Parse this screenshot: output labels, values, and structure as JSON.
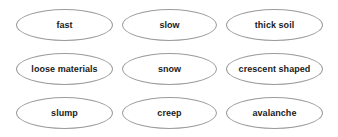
{
  "diagram": {
    "type": "oval-word-bank",
    "rows": 3,
    "columns": 3,
    "background_color": "#ffffff",
    "oval_border_color": "#9c9c9c",
    "text_color": "#1b1b1b",
    "cells": [
      [
        {
          "label": "fast"
        },
        {
          "label": "slow"
        },
        {
          "label": "thick soil"
        }
      ],
      [
        {
          "label": "loose materials"
        },
        {
          "label": "snow"
        },
        {
          "label": "crescent shaped"
        }
      ],
      [
        {
          "label": "slump"
        },
        {
          "label": "creep"
        },
        {
          "label": "avalanche"
        }
      ]
    ]
  }
}
